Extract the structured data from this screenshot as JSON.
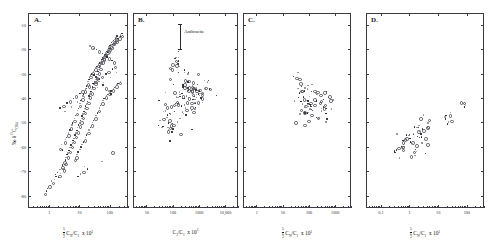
{
  "figure": {
    "panels": [
      {
        "letter": "A.",
        "ylabel": "‰ δ¹³C_CH₄",
        "xlabel_prefix": "Σ",
        "xlabel_sub": "2",
        "xlabel_sup": "5",
        "xlabel_main": "Cₙ/C₁",
        "xlabel_mult": "x 10³",
        "xticks": [
          "1",
          "10",
          "100"
        ],
        "yticks": [
          "-10",
          "-20",
          "-30",
          "-40",
          "-50",
          "-60",
          "-70",
          "-80"
        ]
      },
      {
        "letter": "B.",
        "ylabel": "",
        "xlabel_main": "C₂/C₁",
        "xlabel_mult": "x 10³",
        "xticks": [
          "10",
          "100",
          "1000",
          "10,000"
        ],
        "annotation": "Anthracite"
      },
      {
        "letter": "C.",
        "ylabel": "",
        "xlabel_prefix": "Σ",
        "xlabel_sub": "2",
        "xlabel_sup": "5",
        "xlabel_main": "Cₙ/C₁",
        "xlabel_mult": "x 10³",
        "xticks": [
          "1",
          "10",
          "100",
          "1000"
        ]
      },
      {
        "letter": "D.",
        "ylabel": "",
        "xlabel_prefix": "Σ",
        "xlabel_sub": "2",
        "xlabel_sup": "5",
        "xlabel_main": "Cₙ/C₁",
        "xlabel_mult": "x 10³",
        "xticks": [
          "0.1",
          "1",
          "10",
          "100"
        ]
      }
    ]
  },
  "chart_data": {
    "type": "scatter",
    "title": "",
    "panel_count": 4,
    "shared_ylabel": "‰ δ¹³C-CH₄",
    "ylim": [
      -85,
      -5
    ],
    "ygrid": false,
    "xscale": "log",
    "legend": "none",
    "panels": [
      {
        "id": "A",
        "label": "A.",
        "xlabel": "Σ Cₙ/C₁ x 10³",
        "ylabel": "‰ δ¹³C-CH₄",
        "xlim": [
          0.2,
          400
        ],
        "ylim": [
          -85,
          -5
        ],
        "xticks": [
          1,
          10,
          100
        ],
        "yticks": [
          -10,
          -20,
          -30,
          -40,
          -50,
          -60,
          -70,
          -80
        ],
        "n_points": 300,
        "points": [
          [
            1.9,
            -70.4
          ],
          [
            2.1,
            -71.6
          ],
          [
            2.3,
            -69.1
          ],
          [
            2.0,
            -72.5
          ],
          [
            2.6,
            -68.2
          ],
          [
            2.4,
            -70.8
          ],
          [
            2.8,
            -67.4
          ],
          [
            3.1,
            -66.1
          ],
          [
            2.9,
            -68.8
          ],
          [
            3.4,
            -65.3
          ],
          [
            3.0,
            -69.4
          ],
          [
            3.6,
            -64.2
          ],
          [
            3.9,
            -63.1
          ],
          [
            3.3,
            -66.7
          ],
          [
            4.2,
            -62.4
          ],
          [
            4.5,
            -61.3
          ],
          [
            4.0,
            -64.0
          ],
          [
            4.9,
            -60.2
          ],
          [
            5.3,
            -59.1
          ],
          [
            4.7,
            -61.8
          ],
          [
            5.8,
            -58.3
          ],
          [
            6.2,
            -57.2
          ],
          [
            5.5,
            -59.8
          ],
          [
            6.7,
            -56.4
          ],
          [
            7.1,
            -55.1
          ],
          [
            6.4,
            -57.7
          ],
          [
            7.6,
            -54.3
          ],
          [
            8.2,
            -53.2
          ],
          [
            7.3,
            -55.6
          ],
          [
            8.8,
            -52.1
          ],
          [
            9.4,
            -51.0
          ],
          [
            8.5,
            -53.8
          ],
          [
            10.1,
            -50.2
          ],
          [
            10.8,
            -49.1
          ],
          [
            9.8,
            -51.4
          ],
          [
            11.5,
            -48.3
          ],
          [
            12.3,
            -47.2
          ],
          [
            11.1,
            -49.6
          ],
          [
            13.1,
            -46.4
          ],
          [
            14.0,
            -45.3
          ],
          [
            12.7,
            -47.8
          ],
          [
            15.0,
            -44.2
          ],
          [
            16.0,
            -43.1
          ],
          [
            14.5,
            -45.8
          ],
          [
            17.1,
            -42.4
          ],
          [
            18.3,
            -41.3
          ],
          [
            16.6,
            -43.7
          ],
          [
            19.5,
            -40.2
          ],
          [
            20.9,
            -39.1
          ],
          [
            18.9,
            -41.6
          ],
          [
            22.3,
            -38.3
          ],
          [
            23.8,
            -37.2
          ],
          [
            21.6,
            -39.5
          ],
          [
            25.5,
            -36.4
          ],
          [
            27.2,
            -35.3
          ],
          [
            24.6,
            -37.8
          ],
          [
            29.1,
            -34.2
          ],
          [
            31.1,
            -33.1
          ],
          [
            28.1,
            -35.6
          ],
          [
            33.2,
            -32.4
          ],
          [
            35.5,
            -31.3
          ],
          [
            32.1,
            -33.7
          ],
          [
            37.9,
            -30.2
          ],
          [
            40.5,
            -29.1
          ],
          [
            36.7,
            -31.5
          ],
          [
            43.3,
            -28.3
          ],
          [
            46.2,
            -27.2
          ],
          [
            41.9,
            -29.6
          ],
          [
            49.4,
            -26.4
          ],
          [
            52.8,
            -25.3
          ],
          [
            47.8,
            -27.7
          ],
          [
            56.4,
            -24.2
          ],
          [
            60.2,
            -23.5
          ],
          [
            54.6,
            -25.0
          ],
          [
            64.4,
            -22.8
          ],
          [
            68.8,
            -22.1
          ],
          [
            62.3,
            -23.9
          ],
          [
            73.5,
            -21.4
          ],
          [
            78.5,
            -20.8
          ],
          [
            71.1,
            -22.5
          ],
          [
            83.9,
            -20.2
          ],
          [
            89.6,
            -19.6
          ],
          [
            81.2,
            -21.1
          ],
          [
            95.8,
            -19.0
          ],
          [
            102.3,
            -18.4
          ],
          [
            92.7,
            -19.9
          ],
          [
            109.3,
            -17.8
          ],
          [
            116.8,
            -17.2
          ],
          [
            105.8,
            -18.7
          ],
          [
            124.8,
            -16.8
          ],
          [
            133.3,
            -16.2
          ],
          [
            120.7,
            -17.5
          ],
          [
            142.4,
            -15.9
          ],
          [
            152.1,
            -15.4
          ],
          [
            137.8,
            -16.6
          ],
          [
            162.5,
            -15.0
          ],
          [
            173.6,
            -14.5
          ],
          [
            157.2,
            -15.7
          ],
          [
            1.5,
            -73.2
          ],
          [
            1.7,
            -72.0
          ],
          [
            1.3,
            -74.5
          ],
          [
            1.1,
            -75.8
          ],
          [
            1.6,
            -71.2
          ],
          [
            2.2,
            -60.5
          ],
          [
            2.5,
            -59.0
          ],
          [
            2.7,
            -61.2
          ],
          [
            3.2,
            -58.0
          ],
          [
            3.5,
            -57.0
          ],
          [
            3.8,
            -56.2
          ],
          [
            4.1,
            -55.0
          ],
          [
            4.4,
            -54.2
          ],
          [
            4.8,
            -53.0
          ],
          [
            5.1,
            -52.2
          ],
          [
            5.6,
            -51.0
          ],
          [
            6.0,
            -50.2
          ],
          [
            6.5,
            -49.0
          ],
          [
            7.0,
            -48.2
          ],
          [
            7.5,
            -47.0
          ],
          [
            8.0,
            -46.2
          ],
          [
            8.6,
            -45.0
          ],
          [
            9.2,
            -44.2
          ],
          [
            9.9,
            -43.0
          ],
          [
            10.5,
            -42.2
          ],
          [
            11.3,
            -41.0
          ],
          [
            12.0,
            -40.2
          ],
          [
            12.9,
            -39.0
          ],
          [
            13.8,
            -38.2
          ],
          [
            14.7,
            -37.0
          ],
          [
            15.7,
            -36.2
          ],
          [
            16.8,
            -35.0
          ],
          [
            18.0,
            -34.2
          ],
          [
            19.2,
            -33.0
          ],
          [
            20.5,
            -32.2
          ],
          [
            22.0,
            -31.0
          ],
          [
            23.5,
            -30.5
          ],
          [
            25.1,
            -30.0
          ],
          [
            26.8,
            -29.5
          ],
          [
            28.7,
            -29.0
          ],
          [
            30.7,
            -28.5
          ],
          [
            32.8,
            -28.0
          ],
          [
            35.0,
            -27.5
          ],
          [
            37.5,
            -27.0
          ],
          [
            40.0,
            -26.5
          ],
          [
            42.8,
            -26.0
          ],
          [
            45.8,
            -25.5
          ],
          [
            48.9,
            -25.0
          ],
          [
            52.3,
            -24.5
          ],
          [
            55.9,
            -24.0
          ],
          [
            59.8,
            -23.5
          ],
          [
            63.9,
            -23.0
          ],
          [
            68.3,
            -22.5
          ],
          [
            73.0,
            -22.0
          ],
          [
            78.1,
            -21.5
          ],
          [
            83.5,
            -21.0
          ],
          [
            89.2,
            -20.5
          ],
          [
            95.4,
            -20.0
          ],
          [
            102.0,
            -19.5
          ],
          [
            109.0,
            -19.0
          ],
          [
            116.6,
            -18.5
          ],
          [
            124.6,
            -18.0
          ],
          [
            133.2,
            -17.5
          ],
          [
            142.4,
            -17.2
          ],
          [
            152.3,
            -16.8
          ],
          [
            162.8,
            -16.5
          ],
          [
            174.0,
            -16.0
          ],
          [
            186.0,
            -15.5
          ],
          [
            198.9,
            -15.2
          ],
          [
            212.6,
            -14.8
          ],
          [
            227.3,
            -14.5
          ],
          [
            243.0,
            -14.2
          ],
          [
            8.3,
            -63.0
          ],
          [
            9.0,
            -62.0
          ],
          [
            7.8,
            -64.0
          ],
          [
            10.3,
            -61.0
          ],
          [
            11.2,
            -60.0
          ],
          [
            6.9,
            -65.0
          ],
          [
            12.2,
            -59.0
          ],
          [
            13.4,
            -58.0
          ],
          [
            14.6,
            -57.0
          ],
          [
            16.0,
            -56.0
          ],
          [
            17.4,
            -55.0
          ],
          [
            19.0,
            -54.0
          ],
          [
            20.8,
            -53.0
          ],
          [
            22.7,
            -52.0
          ],
          [
            24.8,
            -51.0
          ],
          [
            27.1,
            -50.0
          ],
          [
            29.6,
            -49.0
          ],
          [
            32.3,
            -48.0
          ],
          [
            35.3,
            -47.0
          ],
          [
            38.5,
            -46.0
          ],
          [
            42.1,
            -45.0
          ],
          [
            46.0,
            -44.0
          ],
          [
            50.2,
            -43.0
          ],
          [
            54.8,
            -42.0
          ],
          [
            59.9,
            -41.0
          ],
          [
            65.4,
            -40.0
          ],
          [
            71.4,
            -39.5
          ],
          [
            78.0,
            -39.0
          ],
          [
            85.2,
            -38.5
          ],
          [
            93.1,
            -38.0
          ],
          [
            101.7,
            -37.5
          ],
          [
            111.0,
            -37.0
          ],
          [
            121.3,
            -36.5
          ],
          [
            132.4,
            -36.0
          ],
          [
            144.7,
            -35.5
          ],
          [
            158.0,
            -35.0
          ],
          [
            172.6,
            -34.5
          ],
          [
            188.5,
            -34.0
          ],
          [
            205.9,
            -33.5
          ],
          [
            224.9,
            -33.0
          ],
          [
            2.3,
            -44.0
          ],
          [
            2.8,
            -43.0
          ],
          [
            3.3,
            -45.5
          ],
          [
            3.9,
            -42.0
          ],
          [
            4.6,
            -41.0
          ],
          [
            5.4,
            -43.5
          ],
          [
            6.4,
            -40.0
          ],
          [
            7.5,
            -39.0
          ],
          [
            8.8,
            -41.5
          ],
          [
            10.4,
            -38.0
          ],
          [
            12.2,
            -37.0
          ],
          [
            14.4,
            -39.5
          ],
          [
            17.0,
            -36.0
          ],
          [
            20.0,
            -35.0
          ],
          [
            23.6,
            -37.5
          ],
          [
            27.8,
            -34.0
          ],
          [
            32.8,
            -33.0
          ],
          [
            38.6,
            -35.5
          ],
          [
            45.5,
            -32.0
          ],
          [
            53.6,
            -31.0
          ],
          [
            63.2,
            -33.5
          ],
          [
            74.5,
            -30.0
          ],
          [
            87.8,
            -29.0
          ],
          [
            103.5,
            -31.5
          ],
          [
            122.0,
            -28.0
          ],
          [
            143.8,
            -27.0
          ],
          [
            169.5,
            -29.5
          ],
          [
            0.9,
            -77.0
          ],
          [
            1.0,
            -76.0
          ],
          [
            1.2,
            -74.0
          ],
          [
            0.8,
            -78.0
          ],
          [
            0.7,
            -79.0
          ],
          [
            230,
            -14.0
          ],
          [
            250,
            -13.5
          ],
          [
            120,
            -62.0
          ],
          [
            55,
            -66.0
          ],
          [
            30,
            -30.5
          ],
          [
            36,
            -31.8
          ],
          [
            44,
            -33.2
          ],
          [
            60,
            -34.5
          ],
          [
            72,
            -35.8
          ],
          [
            95,
            -37.0
          ],
          [
            110,
            -38.2
          ],
          [
            42,
            -20.5
          ],
          [
            50,
            -21.0
          ],
          [
            58,
            -21.5
          ],
          [
            66,
            -22.0
          ],
          [
            30,
            -19.5
          ],
          [
            36,
            -20.0
          ],
          [
            26,
            -19.0
          ],
          [
            22,
            -18.5
          ],
          [
            82,
            -23.0
          ],
          [
            92,
            -23.5
          ],
          [
            104,
            -24.0
          ],
          [
            118,
            -24.5
          ],
          [
            134,
            -25.0
          ],
          [
            15,
            -68.0
          ],
          [
            18,
            -69.0
          ],
          [
            13,
            -70.0
          ],
          [
            11,
            -71.0
          ],
          [
            9,
            -72.0
          ]
        ]
      },
      {
        "id": "B",
        "label": "B.",
        "xlabel": "C₂/C₁ x 10³",
        "xlim": [
          3,
          30000
        ],
        "ylim": [
          -85,
          -5
        ],
        "xticks": [
          10,
          100,
          1000,
          10000
        ],
        "annotation": "Anthracite",
        "n_points": 150
      },
      {
        "id": "C",
        "label": "C.",
        "xlabel": "Σ Cₙ/C₁ x 10³",
        "xlim": [
          0.3,
          4000
        ],
        "ylim": [
          -85,
          -5
        ],
        "xticks": [
          1,
          10,
          100,
          1000
        ],
        "n_points": 80
      },
      {
        "id": "D",
        "label": "D.",
        "xlabel": "Σ Cₙ/C₁ x 10³",
        "xlim": [
          0.03,
          400
        ],
        "ylim": [
          -85,
          -5
        ],
        "xticks": [
          0.1,
          1,
          10,
          100
        ],
        "n_points": 70
      }
    ]
  }
}
